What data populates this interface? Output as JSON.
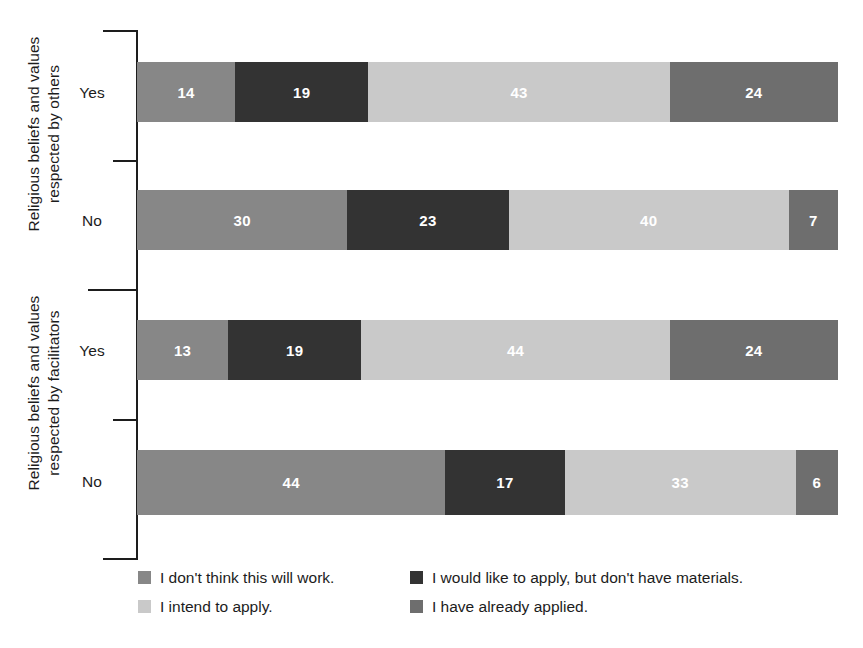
{
  "chart_data": {
    "type": "bar",
    "orientation": "horizontal",
    "stacked": true,
    "normalized_percent": true,
    "title": "",
    "subtitle": "",
    "xlabel": "",
    "ylabel": "",
    "xlim": [
      0,
      100
    ],
    "grid": false,
    "legend_position": "bottom",
    "groups": [
      {
        "label": "Religious beliefs and values\nrespected by others",
        "categories": [
          "Yes",
          "No"
        ]
      },
      {
        "label": "Religious beliefs and values\nrespected by facilitators",
        "categories": [
          "Yes",
          "No"
        ]
      }
    ],
    "categories": [
      "Yes",
      "No",
      "Yes",
      "No"
    ],
    "series": [
      {
        "name": "I don't think this will work.",
        "color": "#878787",
        "values": [
          14,
          30,
          13,
          44
        ]
      },
      {
        "name": "I would like to apply, but don't have materials.",
        "color": "#333333",
        "values": [
          19,
          23,
          19,
          17
        ]
      },
      {
        "name": "I intend to apply.",
        "color": "#c9c9c9",
        "values": [
          43,
          40,
          44,
          33
        ]
      },
      {
        "name": "I have already applied.",
        "color": "#6e6e6e",
        "values": [
          24,
          7,
          24,
          6
        ]
      }
    ],
    "bars": [
      {
        "group": 0,
        "category": "Yes",
        "segments": [
          {
            "series": "I don't think this will work.",
            "value": 14,
            "label": "14",
            "color": "#878787"
          },
          {
            "series": "I would like to apply, but don't have materials.",
            "value": 19,
            "label": "19",
            "color": "#333333"
          },
          {
            "series": "I intend to apply.",
            "value": 43,
            "label": "43",
            "color": "#c9c9c9"
          },
          {
            "series": "I have already applied.",
            "value": 24,
            "label": "24",
            "color": "#6e6e6e"
          }
        ]
      },
      {
        "group": 0,
        "category": "No",
        "segments": [
          {
            "series": "I don't think this will work.",
            "value": 30,
            "label": "30",
            "color": "#878787"
          },
          {
            "series": "I would like to apply, but don't have materials.",
            "value": 23,
            "label": "23",
            "color": "#333333"
          },
          {
            "series": "I intend to apply.",
            "value": 40,
            "label": "40",
            "color": "#c9c9c9"
          },
          {
            "series": "I have already applied.",
            "value": 7,
            "label": "7",
            "color": "#6e6e6e"
          }
        ]
      },
      {
        "group": 1,
        "category": "Yes",
        "segments": [
          {
            "series": "I don't think this will work.",
            "value": 13,
            "label": "13",
            "color": "#878787"
          },
          {
            "series": "I would like to apply, but don't have materials.",
            "value": 19,
            "label": "19",
            "color": "#333333"
          },
          {
            "series": "I intend to apply.",
            "value": 44,
            "label": "44",
            "color": "#c9c9c9"
          },
          {
            "series": "I have already applied.",
            "value": 24,
            "label": "24",
            "color": "#6e6e6e"
          }
        ]
      },
      {
        "group": 1,
        "category": "No",
        "segments": [
          {
            "series": "I don't think this will work.",
            "value": 44,
            "label": "44",
            "color": "#878787"
          },
          {
            "series": "I would like to apply, but don't have materials.",
            "value": 17,
            "label": "17",
            "color": "#333333"
          },
          {
            "series": "I intend to apply.",
            "value": 33,
            "label": "33",
            "color": "#c9c9c9"
          },
          {
            "series": "I have already applied.",
            "value": 6,
            "label": "6",
            "color": "#6e6e6e"
          }
        ]
      }
    ],
    "legend": [
      {
        "label": "I don't think this will work.",
        "color": "#878787"
      },
      {
        "label": "I would like to apply, but don't have materials.",
        "color": "#333333"
      },
      {
        "label": "I intend to apply.",
        "color": "#c9c9c9"
      },
      {
        "label": "I have already applied.",
        "color": "#6e6e6e"
      }
    ]
  },
  "axis": {
    "group_labels": [
      "Religious beliefs and values\nrespected by others",
      "Religious beliefs and values\nrespected by facilitators"
    ],
    "category_labels": [
      "Yes",
      "No",
      "Yes",
      "No"
    ],
    "line_color": "#1d1d1d"
  },
  "colors": {
    "background": "#ffffff",
    "text": "#1c1c1c",
    "value_label": "#ffffff",
    "series_1": "#878787",
    "series_2": "#333333",
    "series_3": "#c9c9c9",
    "series_4": "#6e6e6e"
  }
}
